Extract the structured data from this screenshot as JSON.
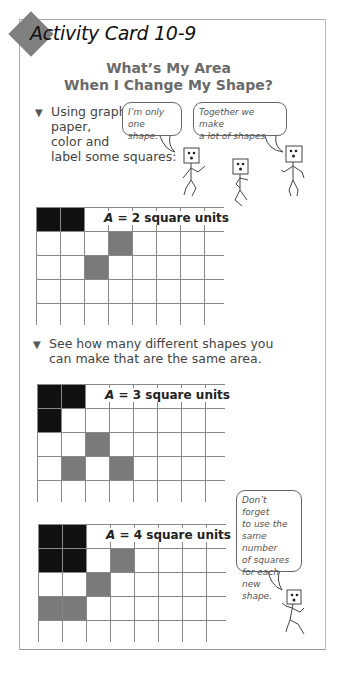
{
  "card": {
    "title": "Activity Card 10-9",
    "heading_line1": "What’s My Area",
    "heading_line2": "When I Change My Shape?"
  },
  "bullets": [
    {
      "lines": [
        "Using graph",
        "paper,",
        "color and",
        "label some squares:"
      ]
    },
    {
      "lines": [
        "See how many different shapes you",
        "can make that are the same area."
      ]
    }
  ],
  "bubbles": [
    {
      "lines": [
        "I’m only",
        "one shape."
      ]
    },
    {
      "lines": [
        "Together we make",
        "a lot of shapes."
      ]
    },
    {
      "lines": [
        "Don’t forget",
        "to use the",
        "same number",
        "of squares",
        "for each new",
        "shape."
      ]
    }
  ],
  "grids": [
    {
      "label_var": "A",
      "label_rest": " = 2 square units",
      "black": [
        [
          0,
          0
        ],
        [
          0,
          1
        ]
      ],
      "gray": [
        [
          1,
          3
        ],
        [
          2,
          2
        ]
      ]
    },
    {
      "label_var": "A",
      "label_rest": " = 3 square units",
      "black": [
        [
          0,
          0
        ],
        [
          0,
          1
        ],
        [
          1,
          0
        ]
      ],
      "gray": [
        [
          2,
          2
        ],
        [
          3,
          1
        ],
        [
          3,
          3
        ]
      ]
    },
    {
      "label_var": "A",
      "label_rest": " = 4 square units",
      "black": [
        [
          0,
          0
        ],
        [
          0,
          1
        ],
        [
          1,
          0
        ],
        [
          1,
          1
        ]
      ],
      "gray": [
        [
          1,
          3
        ],
        [
          2,
          2
        ],
        [
          3,
          0
        ],
        [
          3,
          1
        ]
      ]
    }
  ],
  "colors": {
    "black_cell": "#111111",
    "gray_cell": "#7a7a7a",
    "diamond": "#808080",
    "heading": "#6a6a6a"
  }
}
